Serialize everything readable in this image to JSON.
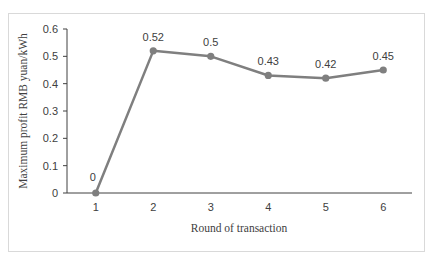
{
  "chart_data": {
    "type": "line",
    "title": "",
    "xlabel": "Round of transaction",
    "ylabel": "Maximum profit RMB yuan/kWh",
    "categories": [
      "1",
      "2",
      "3",
      "4",
      "5",
      "6"
    ],
    "series": [
      {
        "name": "Maximum profit",
        "values": [
          0,
          0.52,
          0.5,
          0.43,
          0.42,
          0.45
        ],
        "color": "#7f7f7f"
      }
    ],
    "data_labels": [
      "0",
      "0.52",
      "0.5",
      "0.43",
      "0.42",
      "0.45"
    ],
    "yticks": [
      "0",
      "0.1",
      "0.2",
      "0.3",
      "0.4",
      "0.5",
      "0.6"
    ],
    "ylim": [
      0,
      0.6
    ],
    "grid": false,
    "legend": "none"
  }
}
